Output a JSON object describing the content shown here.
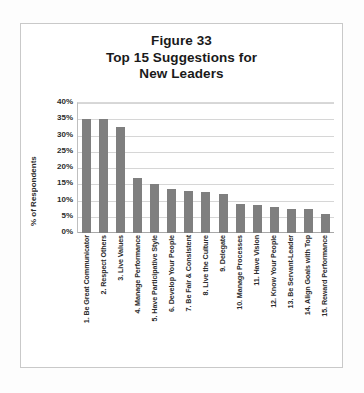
{
  "figure": {
    "title_lines": [
      "Figure 33",
      "Top 15 Suggestions for",
      "New Leaders"
    ],
    "bar_color": "#7f7f7f",
    "gridline_color": "#d6d6d6",
    "plot_background": "#ffffff",
    "frame_border_color": "#c9c9c9"
  },
  "chart_data": {
    "type": "bar",
    "title": "Figure 33 Top 15 Suggestions for New Leaders",
    "xlabel": "",
    "ylabel": "% of Respondents",
    "ylim": [
      0,
      40
    ],
    "ytick_labels": [
      "40%",
      "35%",
      "30%",
      "25%",
      "20%",
      "15%",
      "10%",
      "5%",
      "0%"
    ],
    "ytick_values": [
      40,
      35,
      30,
      25,
      20,
      15,
      10,
      5,
      0
    ],
    "grid": true,
    "legend": false,
    "categories": [
      "1.  Be Great Communicator",
      "2. Respect Others",
      "3. Live Values",
      "4. Manage Performance",
      "5. Have Participative Style",
      "6. Develop Your People",
      "7. Be Fair & Consistent",
      "8. Live the Culture",
      "9. Delegate",
      "10. Manage Processes",
      "11. Have Vision",
      "12. Know Your People",
      "13. Be Servant-Leader",
      "14. Align Goals with Top",
      "15. Reward Performance"
    ],
    "values": [
      35,
      35,
      32.5,
      17,
      15,
      13.5,
      13,
      12.5,
      12,
      9,
      8.5,
      8,
      7.5,
      7.5,
      6
    ]
  }
}
